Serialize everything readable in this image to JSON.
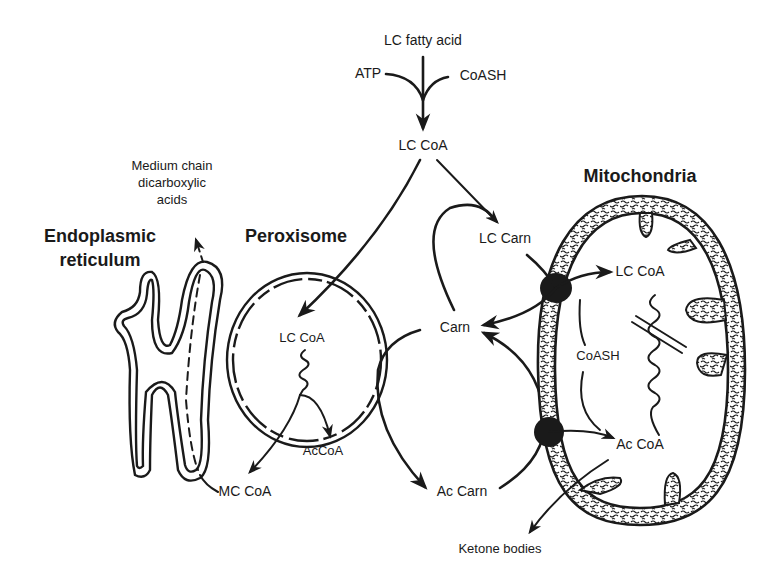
{
  "figure": {
    "type": "metabolic pathway diagram",
    "topic": "Fatty acid oxidation across organelles"
  },
  "organelles": {
    "er": {
      "title_line1": "Endoplasmic",
      "title_line2": "reticulum"
    },
    "peroxisome": {
      "title": "Peroxisome"
    },
    "mitochondria": {
      "title": "Mitochondria"
    }
  },
  "metabolites": {
    "lc_fatty_acid": "LC fatty acid",
    "atp": "ATP",
    "coash_top": "CoASH",
    "lc_coa_cytosol": "LC CoA",
    "lc_carn": "LC Carn",
    "carn": "Carn",
    "ac_carn": "Ac Carn",
    "lc_coa_peroxisome": "LC CoA",
    "accoa_peroxisome": "AcCoA",
    "mc_coa": "MC CoA",
    "mcda_line1": "Medium chain",
    "mcda_line2": "dicarboxylic",
    "mcda_line3": "acids",
    "lc_coa_mito": "LC CoA",
    "coash_mito": "CoASH",
    "ac_coa_mito": "Ac CoA",
    "ketone_bodies": "Ketone bodies"
  },
  "colors": {
    "ink": "#1a1a1a",
    "background": "#ffffff"
  }
}
